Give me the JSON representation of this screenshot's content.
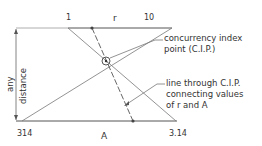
{
  "diagram": {
    "top_scale": {
      "label": "r",
      "left_value": "1",
      "right_value": "10"
    },
    "bottom_scale": {
      "label": "A",
      "left_value": "314",
      "right_value": "3.14"
    },
    "dimension": {
      "line1": "any",
      "line2": "distance"
    },
    "annotations": {
      "cip": [
        "concurrency index",
        "point (C.I.P.)"
      ],
      "through_line": [
        "line through C.I.P.",
        "connecting values",
        "of r and A"
      ]
    },
    "colors": {
      "stroke": "#555555",
      "text": "#333333",
      "background": "#ffffff"
    }
  }
}
